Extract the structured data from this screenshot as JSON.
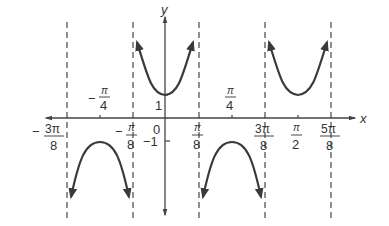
{
  "figure": {
    "function": "y = sec(4x)",
    "axes": {
      "x_label": "x",
      "y_label": "y"
    },
    "y_ticks": [
      {
        "value": 1,
        "label": "1"
      },
      {
        "value": -1,
        "label": "−1"
      }
    ],
    "origin_label": "0",
    "x_ticks_below": [
      {
        "num": "3π",
        "den": "8",
        "sign": "−",
        "value": -0.375
      },
      {
        "num": "π",
        "den": "8",
        "sign": "−",
        "value": -0.125
      },
      {
        "num": "π",
        "den": "8",
        "sign": "",
        "value": 0.125
      },
      {
        "num": "3π",
        "den": "8",
        "sign": "",
        "value": 0.375
      },
      {
        "num": "π",
        "den": "2",
        "sign": "",
        "value": 0.5
      },
      {
        "num": "5π",
        "den": "8",
        "sign": "",
        "value": 0.625
      }
    ],
    "x_ticks_above": [
      {
        "num": "π",
        "den": "4",
        "sign": "−",
        "value": -0.25
      },
      {
        "num": "π",
        "den": "4",
        "sign": "",
        "value": 0.25
      }
    ],
    "asymptotes": [
      "-3π/8",
      "-π/8",
      "π/8",
      "3π/8",
      "5π/8"
    ],
    "branches": [
      {
        "center": "-π/4",
        "direction": "down",
        "extremum": -1
      },
      {
        "center": "0",
        "direction": "up",
        "extremum": 1
      },
      {
        "center": "π/4",
        "direction": "down",
        "extremum": -1
      },
      {
        "center": "π/2",
        "direction": "up",
        "extremum": 1
      }
    ],
    "colors": {
      "curve": "#3a3a3a",
      "axis": "#444444",
      "asymptote": "#555555",
      "text": "#333333"
    }
  }
}
